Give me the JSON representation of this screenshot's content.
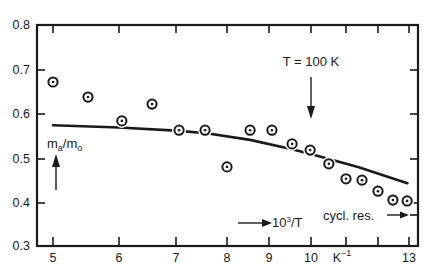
{
  "chart_data": {
    "type": "scatter",
    "title": "",
    "xlabel": "10³/T (K⁻¹)",
    "ylabel": "m_a/m_o",
    "xlim": [
      5,
      13
    ],
    "ylim": [
      0.3,
      0.8
    ],
    "grid": false,
    "x_ticks": [
      5,
      6,
      7,
      8,
      9,
      10,
      11,
      12,
      13
    ],
    "x_tick_labels": [
      "5",
      "6",
      "7",
      "8",
      "9",
      "10",
      "K⁻¹",
      "",
      "13"
    ],
    "x_tick_pixels": [
      53,
      119,
      176,
      227,
      269,
      311,
      346,
      378,
      409
    ],
    "y_ticks": [
      0.3,
      0.4,
      0.5,
      0.6,
      0.7,
      0.8
    ],
    "y_tick_labels": [
      "0.3",
      "0.4",
      "0.5",
      "0.6",
      "0.7",
      "0.8"
    ],
    "series": [
      {
        "name": "measured m_a/m_o",
        "kind": "scatter",
        "marker": "circled-dot",
        "x": [
          5.0,
          5.53,
          6.05,
          6.58,
          7.06,
          7.57,
          8.0,
          8.55,
          9.07,
          9.55,
          9.98,
          10.51,
          11.0,
          11.5,
          12.0,
          12.48,
          12.94
        ],
        "y": [
          0.671,
          0.637,
          0.583,
          0.621,
          0.562,
          0.562,
          0.479,
          0.562,
          0.562,
          0.531,
          0.517,
          0.486,
          0.452,
          0.449,
          0.424,
          0.404,
          0.402
        ]
      },
      {
        "name": "theory curve",
        "kind": "line",
        "x": [
          5.0,
          6.0,
          7.0,
          7.6,
          8.55,
          9.55,
          10.15,
          11.4,
          12.95
        ],
        "y": [
          0.573,
          0.568,
          0.561,
          0.555,
          0.54,
          0.519,
          0.505,
          0.478,
          0.442
        ]
      }
    ],
    "annotations": [
      {
        "text": "T = 100 K",
        "x": 10,
        "y": 0.715,
        "arrow": "down",
        "arrow_to_y": 0.585
      },
      {
        "text": "m_a/m_o",
        "x": 5.05,
        "y": 0.53,
        "arrow": "up"
      },
      {
        "text": "→10³/T",
        "x": 8.4,
        "y": 0.36
      },
      {
        "text": "cycl. res. →",
        "x": 11.0,
        "y": 0.37,
        "points_to": "right-axis",
        "value": 0.37
      }
    ]
  },
  "labels": {
    "y_axis_main": "m",
    "y_axis_sub1": "a",
    "y_axis_slash": "/m",
    "y_axis_sub2": "o",
    "t_annotation": "T = 100 K",
    "x_axis_arrow_label": "10",
    "x_axis_arrow_sup": "3",
    "x_axis_arrow_tail": "/T",
    "x_unit": "K",
    "x_unit_sup": "−1",
    "cyclotron": "cycl. res.",
    "x_ticks": [
      "5",
      "6",
      "7",
      "8",
      "9",
      "10",
      "13"
    ],
    "y_ticks": [
      "0.8",
      "0.7",
      "0.6",
      "0.5",
      "0.4",
      "0.3"
    ]
  }
}
